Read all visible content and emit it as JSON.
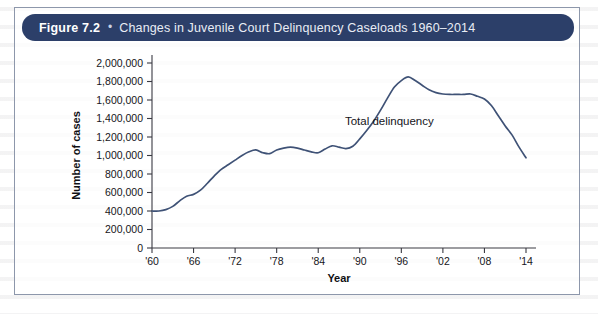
{
  "figure": {
    "number_label": "Figure 7.2",
    "bullet": "•",
    "title": "Changes in Juvenile Court Delinquency Caseloads 1960–2014",
    "header_color": "#2c3f69",
    "header_text_color": "#e9edf5"
  },
  "chart_data": {
    "type": "line",
    "xlabel": "Year",
    "ylabel": "Number of cases",
    "grid": false,
    "legend_position": "inline-annotation",
    "line_color": "#3f5276",
    "xlim": [
      1960,
      2014
    ],
    "ylim": [
      0,
      2000000
    ],
    "ytick_labels": [
      "0",
      "200,000",
      "400,000",
      "600,000",
      "800,000",
      "1,000,000",
      "1,200,000",
      "1,400,000",
      "1,600,000",
      "1,800,000",
      "2,000,000"
    ],
    "ytick_values": [
      0,
      200000,
      400000,
      600000,
      800000,
      1000000,
      1200000,
      1400000,
      1600000,
      1800000,
      2000000
    ],
    "xtick_labels": [
      "'60",
      "'66",
      "'72",
      "'78",
      "'84",
      "'90",
      "'96",
      "'02",
      "'08",
      "'14"
    ],
    "xtick_values": [
      1960,
      1966,
      1972,
      1978,
      1984,
      1990,
      1996,
      2002,
      2008,
      2014
    ],
    "series": [
      {
        "name": "Total delinquency",
        "annotation": "Total delinquency",
        "annotation_x": 1996,
        "annotation_y": 1330000,
        "x": [
          1960,
          1961,
          1962,
          1963,
          1964,
          1965,
          1966,
          1967,
          1968,
          1969,
          1970,
          1971,
          1972,
          1973,
          1974,
          1975,
          1976,
          1977,
          1978,
          1979,
          1980,
          1981,
          1982,
          1983,
          1984,
          1985,
          1986,
          1987,
          1988,
          1989,
          1990,
          1991,
          1992,
          1993,
          1994,
          1995,
          1996,
          1997,
          1998,
          1999,
          2000,
          2001,
          2002,
          2003,
          2004,
          2005,
          2006,
          2007,
          2008,
          2009,
          2010,
          2011,
          2012,
          2013,
          2014
        ],
        "values": [
          400000,
          400000,
          415000,
          450000,
          510000,
          560000,
          580000,
          625000,
          700000,
          780000,
          850000,
          900000,
          950000,
          1000000,
          1040000,
          1060000,
          1030000,
          1020000,
          1060000,
          1080000,
          1090000,
          1080000,
          1060000,
          1040000,
          1030000,
          1070000,
          1105000,
          1090000,
          1075000,
          1100000,
          1180000,
          1270000,
          1370000,
          1490000,
          1620000,
          1740000,
          1810000,
          1850000,
          1810000,
          1760000,
          1710000,
          1680000,
          1665000,
          1660000,
          1660000,
          1660000,
          1665000,
          1640000,
          1610000,
          1540000,
          1430000,
          1320000,
          1220000,
          1090000,
          975000
        ]
      }
    ]
  },
  "axes": {
    "y_axis_title": "Number of cases",
    "x_axis_title": "Year"
  }
}
